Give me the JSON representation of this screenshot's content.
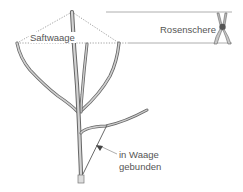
{
  "diagram": {
    "labels": {
      "saftwaage": "Saftwaage",
      "rosenschere": "Rosenschere",
      "tie_line1": "in Waage",
      "tie_line2": "gebunden"
    },
    "icons": {
      "shears": "pruning-shears-icon"
    },
    "colors": {
      "branch_stroke": "#666666",
      "branch_fill": "#c8c8c8",
      "guide_line": "#999999",
      "text": "#555555"
    }
  }
}
